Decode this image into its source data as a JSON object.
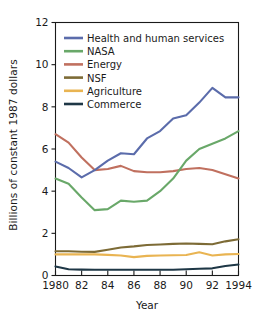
{
  "chart_data": {
    "type": "line",
    "title": "",
    "xlabel": "Year",
    "ylabel": "Billions of constant 1987 dollars",
    "xlim": [
      1980,
      1994
    ],
    "ylim": [
      0,
      12
    ],
    "yticks": [
      0,
      2,
      4,
      6,
      8,
      10,
      12
    ],
    "ytick_labels": [
      "0",
      "2",
      "4",
      "6",
      "8",
      "10",
      "12"
    ],
    "xticks": [
      1980,
      1982,
      1984,
      1986,
      1988,
      1990,
      1992,
      1994
    ],
    "xtick_labels": [
      "1980",
      "82",
      "84",
      "86",
      "88",
      "90",
      "92",
      "1994"
    ],
    "grid": false,
    "legend_position": "upper-left-inside",
    "x": [
      1980,
      1981,
      1982,
      1983,
      1984,
      1985,
      1986,
      1987,
      1988,
      1989,
      1990,
      1991,
      1992,
      1993,
      1994
    ],
    "series": [
      {
        "name": "Health and human services",
        "color": "#5b6cab",
        "values": [
          5.4,
          5.1,
          4.65,
          5.0,
          5.45,
          5.8,
          5.75,
          6.5,
          6.85,
          7.45,
          7.6,
          8.2,
          8.9,
          8.45,
          8.45
        ]
      },
      {
        "name": "NASA",
        "color": "#69a869",
        "values": [
          4.6,
          4.35,
          3.7,
          3.1,
          3.15,
          3.55,
          3.5,
          3.55,
          4.0,
          4.6,
          5.45,
          6.0,
          6.25,
          6.5,
          6.85
        ]
      },
      {
        "name": "Energy",
        "color": "#c0705f",
        "values": [
          6.7,
          6.3,
          5.6,
          5.0,
          5.05,
          5.2,
          4.95,
          4.9,
          4.9,
          4.95,
          5.05,
          5.1,
          5.0,
          4.8,
          4.6
        ]
      },
      {
        "name": "NSF",
        "color": "#7d6b36",
        "values": [
          1.15,
          1.15,
          1.13,
          1.12,
          1.22,
          1.33,
          1.38,
          1.45,
          1.47,
          1.5,
          1.52,
          1.5,
          1.48,
          1.62,
          1.72
        ]
      },
      {
        "name": "Agriculture",
        "color": "#e9b452",
        "values": [
          1.0,
          1.0,
          1.0,
          1.0,
          0.98,
          0.95,
          0.87,
          0.93,
          0.95,
          0.96,
          0.97,
          1.1,
          0.95,
          1.0,
          1.02
        ]
      },
      {
        "name": "Commerce",
        "color": "#1e3746",
        "values": [
          0.43,
          0.3,
          0.28,
          0.27,
          0.27,
          0.27,
          0.27,
          0.27,
          0.27,
          0.27,
          0.3,
          0.32,
          0.34,
          0.45,
          0.52
        ]
      }
    ]
  },
  "legend": {
    "entries": [
      {
        "label": "Health and human services"
      },
      {
        "label": "NASA"
      },
      {
        "label": "Energy"
      },
      {
        "label": "NSF"
      },
      {
        "label": "Agriculture"
      },
      {
        "label": "Commerce"
      }
    ]
  }
}
